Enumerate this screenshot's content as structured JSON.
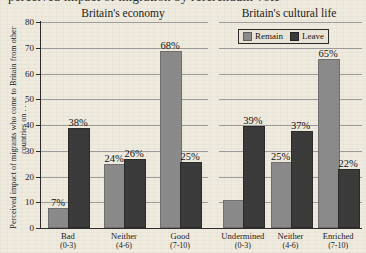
{
  "figure": {
    "clipped_top_text": "perceived impact of migration by referendum vote",
    "ylabel": "Perceived impact of migrants who come to Britain from other countries on . . .",
    "panel_titles": [
      "Britain's economy",
      "Britain's cultural life"
    ],
    "legend": {
      "position": "top-right",
      "items": [
        {
          "label": "Remain",
          "color": "#8a8a8a"
        },
        {
          "label": "Leave",
          "color": "#3a3a3a"
        }
      ]
    },
    "yticks": [
      "0",
      "10",
      "20",
      "30",
      "40",
      "50",
      "60",
      "70",
      "80"
    ]
  },
  "chart_data": {
    "type": "bar",
    "title": "",
    "xlabel": "",
    "ylabel": "Perceived impact of migrants who come to Britain from other countries on . . .",
    "ylim": [
      0,
      80
    ],
    "ytick_step": 10,
    "grid": true,
    "legend_position": "top-right",
    "panels": [
      {
        "title": "Britain's economy",
        "categories": [
          "Bad",
          "Neither",
          "Good"
        ],
        "category_ranges": [
          "(0-3)",
          "(4-6)",
          "(7-10)"
        ],
        "series": [
          {
            "name": "Remain",
            "color": "#8a8a8a",
            "values": [
              7,
              24,
              68
            ],
            "labels": [
              "7%",
              "24%",
              "68%"
            ]
          },
          {
            "name": "Leave",
            "color": "#3a3a3a",
            "values": [
              38,
              26,
              25
            ],
            "labels": [
              "38%",
              "26%",
              "25%"
            ]
          }
        ]
      },
      {
        "title": "Britain's cultural life",
        "categories": [
          "Undermined",
          "Neither",
          "Enriched"
        ],
        "category_ranges": [
          "(0-3)",
          "(4-6)",
          "(7-10)"
        ],
        "series": [
          {
            "name": "Remain",
            "color": "#8a8a8a",
            "values": [
              10,
              25,
              65
            ],
            "labels": [
              "",
              "25%",
              "65%"
            ]
          },
          {
            "name": "Leave",
            "color": "#3a3a3a",
            "values": [
              39,
              37,
              22
            ],
            "labels": [
              "39%",
              "37%",
              "22%"
            ]
          }
        ]
      }
    ]
  }
}
